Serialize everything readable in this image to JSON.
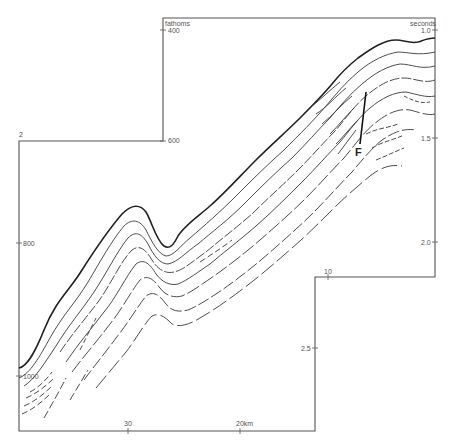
{
  "figure": {
    "type": "seismic reflection profile line drawing",
    "left_axis": {
      "unit_label": "fathoms",
      "ticks": [
        {
          "label": "400",
          "y": 30
        },
        {
          "label": "600",
          "y": 141
        },
        {
          "label": "800",
          "y": 243
        },
        {
          "label": "1000",
          "y": 376
        }
      ],
      "corner_mark": "2"
    },
    "right_axis": {
      "unit_label": "seconds",
      "ticks": [
        {
          "label": "1.0",
          "y": 30
        },
        {
          "label": "1.5",
          "y": 138
        },
        {
          "label": "2.0",
          "y": 242
        },
        {
          "label": "2.5",
          "y": 348
        }
      ]
    },
    "bottom_axis": {
      "ticks": [
        {
          "label": "30",
          "x": 128
        },
        {
          "label": "20km",
          "x": 240
        },
        {
          "label": "10",
          "x": 328
        }
      ]
    },
    "annotations": [
      {
        "label": "F",
        "meaning": "fault",
        "x": 356,
        "y": 148
      }
    ],
    "line_color": "#3a3a3a",
    "frame_color": "#555555"
  }
}
